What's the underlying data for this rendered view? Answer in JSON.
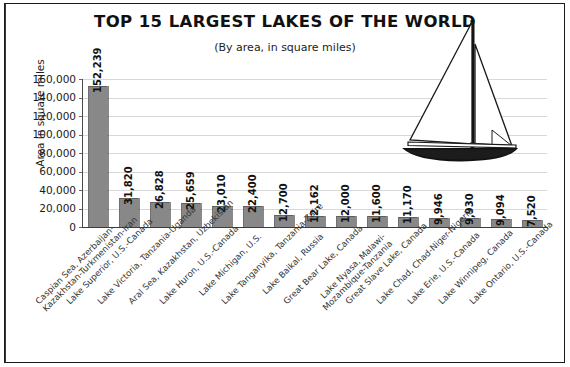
{
  "chart_data": {
    "type": "bar",
    "title": "TOP 15 LARGEST LAKES OF THE WORLD",
    "subtitle": "(By area, in square miles)",
    "xlabel": "",
    "ylabel": "Area in square miles",
    "ylim": [
      0,
      160000
    ],
    "ytick_labels": [
      "160,000",
      "140,000",
      "120,000",
      "100,000",
      "80,000",
      "60,000",
      "40,000",
      "20,000",
      "0"
    ],
    "ytick_values": [
      160000,
      140000,
      120000,
      100000,
      80000,
      60000,
      40000,
      20000,
      0
    ],
    "grid": true,
    "legend": "none",
    "bar_color": "#888888",
    "categories": [
      "Caspian Sea, Azerbaijan-\nKazakhstan-Turkmenistan-Iran",
      "Lake Superior, U.S.-Canada",
      "Lake Victoria, Tanzania-Uganda",
      "Aral Sea, Kazakhstan, Uzbekistan",
      "Lake Huron, U.S.-Canada",
      "Lake Michigan, U.S.",
      "Lake Tanganyika, Tanzania-Zaire",
      "Lake Baikal, Russia",
      "Great Bear Lake, Canada",
      "Lake Nyasa, Malawi-\nMozambique-Tanzania",
      "Great Slave Lake, Canada",
      "Lake Chad, Chad-Niger-Nigeria",
      "Lake Erie, U.S.-Canada",
      "Lake Winnipeg, Canada",
      "Lake Ontario, U.S.-Canada"
    ],
    "values": [
      152239,
      31820,
      26828,
      25659,
      23010,
      22400,
      12700,
      12162,
      12000,
      11600,
      11170,
      9946,
      9930,
      9094,
      7520
    ],
    "value_labels": [
      "152,239",
      "31,820",
      "26,828",
      "25,659",
      "23,010",
      "22,400",
      "12,700",
      "12,162",
      "12,000",
      "11,600",
      "11,170",
      "9,946",
      "9,930",
      "9,094",
      "7,520"
    ]
  },
  "illustration": {
    "name": "sailboat-illustration"
  }
}
